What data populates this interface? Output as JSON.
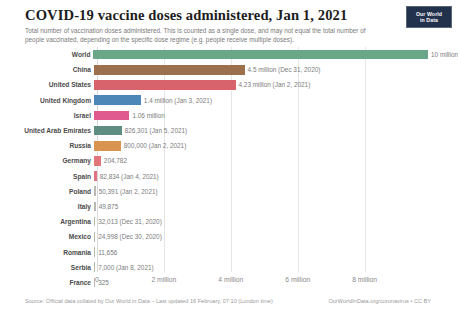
{
  "header": {
    "title": "COVID-19 vaccine doses administered, Jan 1, 2021",
    "subtitle": "Total number of vaccination doses administered. This is counted as a single dose, and may not equal the total number of people vaccinated, depending on the specific dose regime (e.g. people receive multiple doses).",
    "logo_line1": "Our World",
    "logo_line2": "in Data"
  },
  "footer": {
    "source": "Source: Official data collated by Our World in Data – Last updated 16 February, 07:10 (London time)",
    "credit": "OurWorldInData.org/coronavirus • CC BY"
  },
  "chart_data": {
    "type": "bar",
    "orientation": "horizontal",
    "title": "COVID-19 vaccine doses administered, Jan 1, 2021",
    "xlabel": "",
    "ylabel": "",
    "xlim": [
      0,
      10700000
    ],
    "grid": true,
    "legend": "none",
    "xticks": [
      0,
      2000000,
      4000000,
      6000000,
      8000000
    ],
    "xtick_labels": [
      "0",
      "2 million",
      "4 million",
      "6 million",
      "8 million"
    ],
    "categories": [
      "World",
      "China",
      "United States",
      "United Kingdom",
      "Israel",
      "United Arab Emirates",
      "Russia",
      "Germany",
      "Spain",
      "Poland",
      "Italy",
      "Argentina",
      "Mexico",
      "Romania",
      "Serbia",
      "France"
    ],
    "values": [
      10000000,
      4500000,
      4230000,
      1400000,
      1060000,
      826301,
      800000,
      204782,
      82834,
      50391,
      49875,
      32013,
      24998,
      11656,
      7000,
      325
    ],
    "value_labels": [
      "10 million",
      "4.5 million (Dec 31, 2020)",
      "4.23 million (Jan 2, 2021)",
      "1.4 million (Jan 3, 2021)",
      "1.06 million",
      "826,301 (Jan 5, 2021)",
      "800,000 (Jan 2, 2021)",
      "204,782",
      "82,834 (Jan 4, 2021)",
      "50,391 (Jan 2, 2021)",
      "49,875",
      "32,013 (Dec 31, 2020)",
      "24,998 (Dec 30, 2020)",
      "11,656",
      "7,000 (Jan 8, 2021)",
      "325"
    ],
    "colors": [
      "#6aa789",
      "#9c6f4d",
      "#d9636d",
      "#4c87b8",
      "#e05a8f",
      "#5e8d82",
      "#d99550",
      "#e0757a",
      "#e0737f",
      "#b8b8b8",
      "#b8b8b8",
      "#b8b8b8",
      "#b8b8b8",
      "#b8b8b8",
      "#b8b8b8",
      "#b8b8b8"
    ]
  }
}
